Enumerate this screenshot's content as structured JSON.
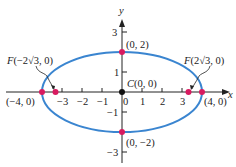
{
  "diagram": {
    "type": "ellipse",
    "equation_params": {
      "a": 4,
      "b": 2,
      "c": "2√3"
    },
    "colors": {
      "ellipse": "#3a85d0",
      "points": "#d81b60",
      "axes": "#222222",
      "center": "#111111"
    },
    "axes": {
      "x_label": "x",
      "y_label": "y"
    },
    "x_ticks": [
      {
        "value": -3,
        "label": "−3"
      },
      {
        "value": -2,
        "label": "−2"
      },
      {
        "value": -1,
        "label": "−1"
      },
      {
        "value": 0,
        "label": "0"
      },
      {
        "value": 1,
        "label": "1"
      },
      {
        "value": 2,
        "label": "2"
      },
      {
        "value": 3,
        "label": "3"
      }
    ],
    "y_ticks": [
      {
        "value": 3,
        "label": "3"
      },
      {
        "value": 1,
        "label": "1"
      },
      {
        "value": -1,
        "label": "−1"
      },
      {
        "value": -3,
        "label": "−3"
      }
    ],
    "labels": {
      "top_vertex": "(0, 2)",
      "bottom_vertex": "(0, −2)",
      "left_vertex": "(−4, 0)",
      "right_vertex": "(4, 0)",
      "center_prefix": "C",
      "center": "(0, 0)",
      "left_focus_prefix": "F",
      "left_focus": "(−2√3, 0)",
      "right_focus_prefix": "F",
      "right_focus": "(2√3, 0)"
    }
  }
}
